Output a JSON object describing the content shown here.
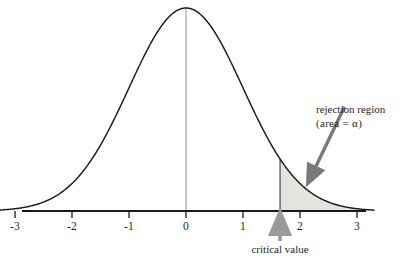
{
  "chart_data": {
    "type": "area",
    "title": "",
    "subtitle": "",
    "xlabel": "",
    "ylabel": "",
    "distribution": "standard normal",
    "xlim": [
      -3.3,
      3.3
    ],
    "ylim": [
      0,
      0.42
    ],
    "grid": false,
    "legend": null,
    "x_tick_labels": [
      "-3",
      "-2",
      "-1",
      "0",
      "1",
      "2",
      "3"
    ],
    "x_tick_values": [
      -3,
      -2,
      -1,
      0,
      1,
      2,
      3
    ],
    "curve": {
      "name": "standard normal density",
      "x": [
        -3.3,
        -3,
        -2.75,
        -2.5,
        -2.25,
        -2,
        -1.75,
        -1.5,
        -1.25,
        -1,
        -0.75,
        -0.5,
        -0.25,
        0,
        0.25,
        0.5,
        0.75,
        1,
        1.25,
        1.5,
        1.65,
        1.75,
        2,
        2.25,
        2.5,
        2.75,
        3,
        3.3
      ],
      "y": [
        0.0017,
        0.0044,
        0.0091,
        0.0175,
        0.0317,
        0.054,
        0.0863,
        0.1295,
        0.1826,
        0.242,
        0.3011,
        0.3521,
        0.3867,
        0.3989,
        0.3867,
        0.3521,
        0.3011,
        0.242,
        0.1826,
        0.1295,
        0.1023,
        0.0863,
        0.054,
        0.0317,
        0.0175,
        0.0091,
        0.0044,
        0.0017
      ]
    },
    "shaded_region": {
      "label": "rejection region",
      "from": 1.65,
      "to": 3,
      "area": "alpha",
      "fill_color": "#e3e3e0",
      "outline_color": "#1a1a1a"
    },
    "center_line": {
      "x": 0,
      "color": "#9a9a9a"
    },
    "annotations": [
      {
        "name": "rejection-region",
        "line1": "rejection region",
        "line2": "(area = α)",
        "arrow_from": [
          2.78,
          0.205
        ],
        "arrow_to": [
          2.14,
          0.055
        ],
        "arrow_color": "#7a7a7a"
      },
      {
        "name": "critical-value",
        "text": "critical value",
        "points_to": 1.65,
        "arrow_color": "#9a9a9a"
      }
    ],
    "axis_color": "#1a1a1a",
    "curve_color": "#1a1a1a"
  },
  "labels": {
    "ticks": [
      {
        "text": "-3",
        "x": 29
      },
      {
        "text": "-2",
        "x": 86
      },
      {
        "text": "-1",
        "x": 143
      },
      {
        "text": "0",
        "x": 186
      },
      {
        "text": "1",
        "x": 243
      },
      {
        "text": "2",
        "x": 300
      },
      {
        "text": "3",
        "x": 357
      }
    ],
    "rejection_line1": "rejection region",
    "rejection_line2": "(area = α)",
    "critical_value": "critical value"
  }
}
